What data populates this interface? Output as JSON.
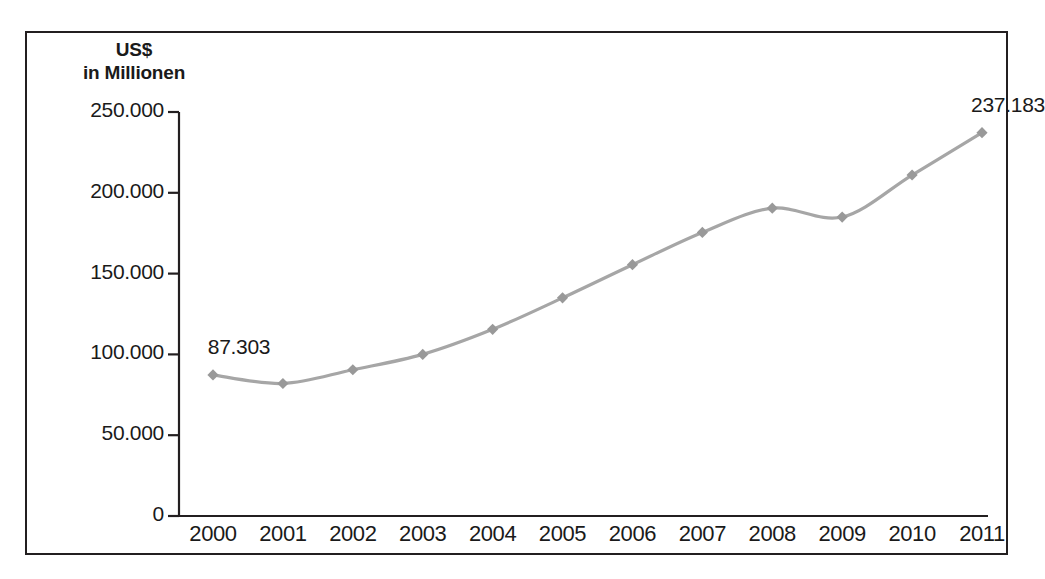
{
  "figure": {
    "axis_title_line1": "US$",
    "axis_title_line2": "in Millionen",
    "line_color": "#a6a6a6",
    "marker_color": "#999999",
    "axis_color": "#231f20",
    "frame_color": "#231f20",
    "background": "#ffffff"
  },
  "chart_data": {
    "type": "line",
    "title": "US$ in Millionen",
    "xlabel": "",
    "ylabel": "US$ in Millionen",
    "categories": [
      "2000",
      "2001",
      "2002",
      "2003",
      "2004",
      "2005",
      "2006",
      "2007",
      "2008",
      "2009",
      "2010",
      "2011"
    ],
    "values": [
      87303,
      82000,
      90500,
      100000,
      115500,
      135000,
      155500,
      175500,
      190500,
      185000,
      211000,
      237183
    ],
    "point_labels": [
      {
        "category": "2000",
        "text": "87.303"
      },
      {
        "category": "2011",
        "text": "237.183"
      }
    ],
    "ylim": [
      0,
      250000
    ],
    "yticks": [
      0,
      50000,
      100000,
      150000,
      200000,
      250000
    ],
    "ytick_labels": [
      "0",
      "50.000",
      "100.000",
      "150.000",
      "200.000",
      "250.000"
    ],
    "grid": false,
    "legend": false,
    "marker": "diamond"
  }
}
